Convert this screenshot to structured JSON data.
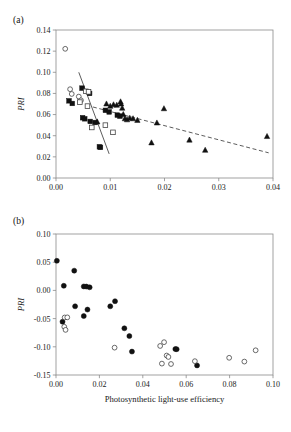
{
  "figure": {
    "panels": [
      {
        "id": "a",
        "label": "(a)",
        "ylabel": "PRI",
        "xlabel": ""
      },
      {
        "id": "b",
        "label": "(b)",
        "ylabel": "PRI",
        "xlabel": "Photosynthetic light-use efficiency"
      }
    ]
  },
  "chart_data": [
    {
      "type": "scatter",
      "panel": "a",
      "title": "",
      "xlabel": "",
      "ylabel": "PRI",
      "xlim": [
        0.0,
        0.04
      ],
      "ylim": [
        0.0,
        0.14
      ],
      "xticks": [
        0.0,
        0.01,
        0.02,
        0.03,
        0.04
      ],
      "xticklabels": [
        "0.00",
        "0.01",
        "0.02",
        "0.03",
        "0.04"
      ],
      "yticks": [
        0.0,
        0.02,
        0.04,
        0.06,
        0.08,
        0.1,
        0.12,
        0.14
      ],
      "yticklabels": [
        "0.00",
        "0.02",
        "0.04",
        "0.06",
        "0.08",
        "0.10",
        "0.12",
        "0.14"
      ],
      "grid": false,
      "legend": false,
      "series": [
        {
          "name": "open-circle",
          "marker": "open-circle",
          "points": [
            [
              0.0017,
              0.1222
            ],
            [
              0.0026,
              0.084
            ],
            [
              0.0029,
              0.0795
            ],
            [
              0.0042,
              0.077
            ],
            [
              0.0046,
              0.0735
            ]
          ]
        },
        {
          "name": "filled-square",
          "marker": "filled-square",
          "points": [
            [
              0.0024,
              0.073
            ],
            [
              0.003,
              0.0705
            ],
            [
              0.0048,
              0.085
            ],
            [
              0.0062,
              0.08
            ],
            [
              0.0049,
              0.057
            ],
            [
              0.0053,
              0.056
            ],
            [
              0.0063,
              0.0535
            ],
            [
              0.0072,
              0.0525
            ],
            [
              0.008,
              0.0295
            ],
            [
              0.0082,
              0.029
            ],
            [
              0.0091,
              0.064
            ],
            [
              0.0098,
              0.0625
            ],
            [
              0.0113,
              0.0595
            ],
            [
              0.0118,
              0.0585
            ]
          ]
        },
        {
          "name": "open-square",
          "marker": "open-square",
          "points": [
            [
              0.0044,
              0.0718
            ],
            [
              0.0055,
              0.082
            ],
            [
              0.006,
              0.0815
            ],
            [
              0.0058,
              0.068
            ],
            [
              0.0066,
              0.0478
            ],
            [
              0.0091,
              0.05
            ],
            [
              0.0105,
              0.0432
            ]
          ]
        },
        {
          "name": "filled-triangle",
          "marker": "filled-triangle",
          "points": [
            [
              0.0076,
              0.053
            ],
            [
              0.0093,
              0.07
            ],
            [
              0.01,
              0.0678
            ],
            [
              0.0106,
              0.0692
            ],
            [
              0.0112,
              0.0688
            ],
            [
              0.0119,
              0.072
            ],
            [
              0.012,
              0.07
            ],
            [
              0.0122,
              0.066
            ],
            [
              0.0124,
              0.06
            ],
            [
              0.0127,
              0.056
            ],
            [
              0.0131,
              0.055
            ],
            [
              0.0136,
              0.0565
            ],
            [
              0.0142,
              0.056
            ],
            [
              0.015,
              0.0545
            ],
            [
              0.0176,
              0.0332
            ],
            [
              0.0186,
              0.052
            ],
            [
              0.0199,
              0.0655
            ],
            [
              0.0246,
              0.0358
            ],
            [
              0.0275,
              0.0262
            ],
            [
              0.0389,
              0.0392
            ]
          ]
        }
      ],
      "fit_lines": [
        {
          "name": "solid-regression",
          "style": "solid",
          "x0": 0.0042,
          "y0": 0.1,
          "x1": 0.0098,
          "y1": 0.0228
        },
        {
          "name": "dashed-regression",
          "style": "dashed",
          "x0": 0.0068,
          "y0": 0.0672,
          "x1": 0.0392,
          "y1": 0.0238
        }
      ]
    },
    {
      "type": "scatter",
      "panel": "b",
      "title": "",
      "xlabel": "Photosynthetic light-use efficiency",
      "ylabel": "PRI",
      "xlim": [
        0.0,
        0.1
      ],
      "ylim": [
        -0.15,
        0.1
      ],
      "xticks": [
        0.0,
        0.02,
        0.04,
        0.06,
        0.08,
        0.1
      ],
      "xticklabels": [
        "0.00",
        "0.02",
        "0.04",
        "0.06",
        "0.08",
        "0.10"
      ],
      "yticks": [
        -0.15,
        -0.1,
        -0.05,
        0.0,
        0.05,
        0.1
      ],
      "yticklabels": [
        "-0.15",
        "-0.10",
        "-0.05",
        "0.00",
        "0.05",
        "0.10"
      ],
      "grid": false,
      "legend": false,
      "series": [
        {
          "name": "filled-circle",
          "marker": "filled-circle",
          "points": [
            [
              0.0004,
              0.0525
            ],
            [
              0.0036,
              0.0082
            ],
            [
              0.0084,
              0.035
            ],
            [
              0.0128,
              0.007
            ],
            [
              0.014,
              0.0068
            ],
            [
              0.0155,
              0.0055
            ],
            [
              0.0088,
              -0.0282
            ],
            [
              0.0145,
              -0.034
            ],
            [
              0.0128,
              -0.0455
            ],
            [
              0.003,
              -0.0555
            ],
            [
              0.025,
              -0.0282
            ],
            [
              0.0272,
              -0.0192
            ],
            [
              0.0315,
              -0.0672
            ],
            [
              0.0338,
              -0.081
            ],
            [
              0.035,
              -0.1085
            ],
            [
              0.055,
              -0.104
            ],
            [
              0.0556,
              -0.1042
            ],
            [
              0.065,
              -0.133
            ]
          ]
        },
        {
          "name": "open-circle",
          "marker": "open-circle",
          "points": [
            [
              0.004,
              -0.048
            ],
            [
              0.0052,
              -0.0478
            ],
            [
              0.0038,
              -0.0645
            ],
            [
              0.0044,
              -0.07
            ],
            [
              0.027,
              -0.1015
            ],
            [
              0.048,
              -0.0985
            ],
            [
              0.0498,
              -0.0918
            ],
            [
              0.051,
              -0.1155
            ],
            [
              0.0518,
              -0.118
            ],
            [
              0.0488,
              -0.1298
            ],
            [
              0.053,
              -0.1305
            ],
            [
              0.064,
              -0.1255
            ],
            [
              0.0798,
              -0.1195
            ],
            [
              0.0868,
              -0.1262
            ],
            [
              0.092,
              -0.1062
            ]
          ]
        }
      ]
    }
  ]
}
